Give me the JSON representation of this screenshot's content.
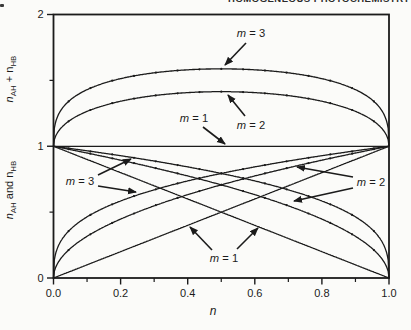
{
  "header": {
    "running_title": "HOMOGENEOUS PHOTOCHEMISTRY"
  },
  "colors": {
    "ink": "#1b1b1b",
    "paper": "#fbfbf9"
  },
  "chart_data": {
    "type": "line",
    "title": "",
    "xlabel": "n",
    "x_axis": {
      "label": "n",
      "range": [
        0,
        1
      ],
      "ticks": [
        {
          "v": 0.0,
          "label": "0.0"
        },
        {
          "v": 0.2,
          "label": "0.2"
        },
        {
          "v": 0.4,
          "label": "0.4"
        },
        {
          "v": 0.6,
          "label": "0.6"
        },
        {
          "v": 0.8,
          "label": "0.8"
        },
        {
          "v": 1.0,
          "label": "1.0"
        }
      ],
      "minor_ticks": [
        0.1,
        0.3,
        0.5,
        0.7,
        0.9
      ]
    },
    "y_axis": {
      "range": [
        0,
        2
      ],
      "ticks": [
        {
          "v": 0,
          "label": "0"
        },
        {
          "v": 1,
          "label": "1"
        },
        {
          "v": 2,
          "label": "2"
        }
      ],
      "minor_ticks": [
        0.5,
        1.5
      ],
      "label_top": "n_{AH} + n_{HB}",
      "label_bottom": "n_{AH} and n_{HB}"
    },
    "grid": false,
    "formulas": {
      "sum": "n_AH + n_HB = n^(1/m) + (1-n)^(1/m)",
      "nHB": "n_HB = n^(1/m)",
      "nAH": "n_AH = (1-n)^(1/m)"
    },
    "series": [
      {
        "name": "n_AH + n_HB, m = 1 (horizontal line at 1)",
        "group": "sum",
        "m": 1,
        "dots": false
      },
      {
        "name": "n_AH + n_HB, m = 2",
        "group": "sum",
        "m": 2,
        "dots": true
      },
      {
        "name": "n_AH + n_HB, m = 3",
        "group": "sum",
        "m": 3,
        "dots": true
      },
      {
        "name": "n_AH, m = 1 (line 1 to 0)",
        "group": "nAH",
        "m": 1,
        "dots": false
      },
      {
        "name": "n_AH, m = 2",
        "group": "nAH",
        "m": 2,
        "dots": true
      },
      {
        "name": "n_AH, m = 3",
        "group": "nAH",
        "m": 3,
        "dots": true
      },
      {
        "name": "n_HB, m = 1 (line 0 to 1)",
        "group": "nHB",
        "m": 1,
        "dots": false
      },
      {
        "name": "n_HB, m = 2",
        "group": "nHB",
        "m": 2,
        "dots": true
      },
      {
        "name": "n_HB, m = 3",
        "group": "nHB",
        "m": 3,
        "dots": true
      }
    ],
    "key_values": {
      "sum_max_at_n": 0.5,
      "sum_max_m1": 1.0,
      "sum_max_m2": 1.414,
      "sum_max_m3": 1.587,
      "endpoints": "sum curves equal 1 at n=0 and n=1; nAH runs 1 to 0, nHB runs 0 to 1"
    },
    "annotations": [
      {
        "label": "m = 3",
        "x": 251,
        "y": 33,
        "arrows": [
          [
            246,
            43,
            225,
            65
          ]
        ]
      },
      {
        "label": "m = 2",
        "x": 251,
        "y": 125,
        "arrows": [
          [
            245,
            116,
            228,
            95
          ]
        ]
      },
      {
        "label": "m = 1",
        "x": 194,
        "y": 118,
        "arrows": [
          [
            203,
            127,
            225,
            144
          ]
        ]
      },
      {
        "label": "m = 3",
        "x": 80,
        "y": 181,
        "arrows": [
          [
            98,
            175,
            131,
            159
          ],
          [
            98,
            186,
            136,
            192
          ]
        ]
      },
      {
        "label": "m = 2",
        "x": 371,
        "y": 182,
        "arrows": [
          [
            353,
            177,
            297,
            167
          ],
          [
            353,
            188,
            294,
            201
          ]
        ]
      },
      {
        "label": "m = 1",
        "x": 224,
        "y": 258,
        "arrows": [
          [
            212,
            250,
            190,
            227
          ],
          [
            237,
            249,
            258,
            228
          ]
        ]
      }
    ]
  }
}
